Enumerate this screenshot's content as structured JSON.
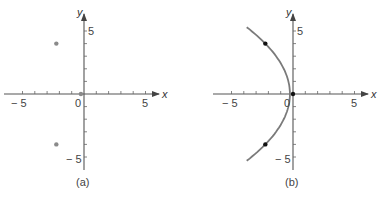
{
  "chart_data": [
    {
      "type": "scatter",
      "panel_label": "(a)",
      "xlabel": "x",
      "ylabel": "y",
      "x_tick_labels": [
        "-5",
        "0",
        "5"
      ],
      "y_tick_labels": [
        "5",
        "-5"
      ],
      "xlim": [
        -6,
        6
      ],
      "ylim": [
        -6,
        6
      ],
      "grid": false,
      "points": [
        {
          "x": -2,
          "y": 4
        },
        {
          "x": -2,
          "y": -4
        },
        {
          "x": 0,
          "y": 0
        }
      ],
      "point_color": "#8a8a8a"
    },
    {
      "type": "line",
      "panel_label": "(b)",
      "xlabel": "x",
      "ylabel": "y",
      "x_tick_labels": [
        "-5",
        "0",
        "5"
      ],
      "y_tick_labels": [
        "5",
        "-5"
      ],
      "xlim": [
        -6,
        6
      ],
      "ylim": [
        -6,
        6
      ],
      "grid": false,
      "curve": {
        "equation": "x = -y^2/8",
        "y_range": [
          -5.3,
          5.3
        ],
        "color": "#7a7a7a"
      },
      "points": [
        {
          "x": -2,
          "y": 4
        },
        {
          "x": -2,
          "y": -4
        },
        {
          "x": 0,
          "y": 0
        }
      ],
      "point_color": "#111111"
    }
  ],
  "panels": {
    "a": {
      "caption": "(a)",
      "x_axis_label": "x",
      "y_axis_label": "y",
      "x_neg5": "− 5",
      "x_0": "0",
      "x_5": "5",
      "y_5": "5",
      "y_neg5": "− 5"
    },
    "b": {
      "caption": "(b)",
      "x_axis_label": "x",
      "y_axis_label": "y",
      "x_neg5": "− 5",
      "x_0": "0",
      "x_5": "5",
      "y_5": "5",
      "y_neg5": "− 5"
    }
  }
}
